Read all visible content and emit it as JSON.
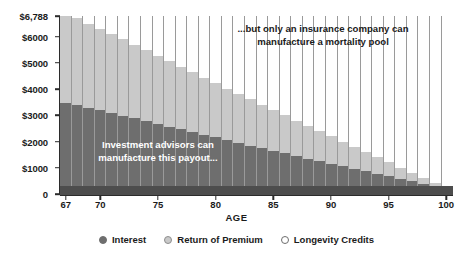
{
  "chart_data": {
    "type": "bar",
    "subtype": "stacked-bar",
    "title": "",
    "xlabel": "AGE",
    "ylabel": "",
    "ylim": [
      0,
      6788
    ],
    "grid": false,
    "legend_position": "bottom",
    "total_per_bar": 6788,
    "categories": [
      67,
      68,
      69,
      70,
      71,
      72,
      73,
      74,
      75,
      76,
      77,
      78,
      79,
      80,
      81,
      82,
      83,
      84,
      85,
      86,
      87,
      88,
      89,
      90,
      91,
      92,
      93,
      94,
      95,
      96,
      97,
      98,
      99,
      100
    ],
    "x_tick_labels": [
      "67",
      "70",
      "75",
      "80",
      "85",
      "90",
      "95",
      "100"
    ],
    "x_tick_values": [
      67,
      70,
      75,
      80,
      85,
      90,
      95,
      100
    ],
    "y_tick_labels": [
      "$6,788",
      "$6000",
      "$5000",
      "$4000",
      "$3000",
      "$2000",
      "$1000",
      "0"
    ],
    "y_tick_values": [
      6788,
      6000,
      5000,
      4000,
      3000,
      2000,
      1000,
      0
    ],
    "series": [
      {
        "name": "Interest",
        "color": "#6e6e6e",
        "values": [
          3460,
          3380,
          3290,
          3190,
          3090,
          2990,
          2880,
          2780,
          2680,
          2570,
          2470,
          2360,
          2260,
          2160,
          2050,
          1950,
          1850,
          1750,
          1650,
          1550,
          1450,
          1350,
          1250,
          1150,
          1050,
          950,
          860,
          760,
          670,
          570,
          480,
          380,
          290,
          0
        ]
      },
      {
        "name": "Return of Premium",
        "color": "#c9c9c9",
        "values": [
          3328,
          3320,
          3200,
          3120,
          3010,
          2910,
          2800,
          2700,
          2600,
          2490,
          2380,
          2280,
          2180,
          2070,
          1970,
          1870,
          1760,
          1660,
          1560,
          1450,
          1350,
          1250,
          1150,
          1050,
          950,
          850,
          740,
          640,
          540,
          440,
          340,
          240,
          130,
          0
        ]
      },
      {
        "name": "Longevity Credits",
        "color": "#ffffff",
        "values": [
          0,
          88,
          298,
          478,
          688,
          888,
          1108,
          1308,
          1508,
          1728,
          1938,
          2148,
          2348,
          2558,
          2768,
          2968,
          3178,
          3378,
          3578,
          3788,
          3988,
          4188,
          4388,
          4588,
          4788,
          4988,
          5188,
          5388,
          5578,
          5778,
          5968,
          6168,
          6368,
          6788
        ]
      }
    ],
    "annotations": [
      {
        "id": "insurance-note",
        "text": "...but only an insurance company can\nmanufacture a mortality pool"
      },
      {
        "id": "advisor-note",
        "text": "Investment advisors can\nmanufacture this payout..."
      }
    ]
  },
  "legend": {
    "items": [
      {
        "label": "Interest",
        "marker": "filled-circle-icon"
      },
      {
        "label": "Return of Premium",
        "marker": "ring-circle-icon"
      },
      {
        "label": "Longevity Credits",
        "marker": "hollow-circle-icon"
      }
    ]
  },
  "axis": {
    "x_title": "AGE"
  },
  "colors": {
    "interest": "#6e6e6e",
    "return_of_premium": "#c9c9c9",
    "longevity_credits": "#ffffff",
    "axis": "#2b2b2b",
    "baseline_band": "#4d4d4d",
    "bar_separator": "#9a9a9a",
    "text": "#1b1b1b"
  }
}
